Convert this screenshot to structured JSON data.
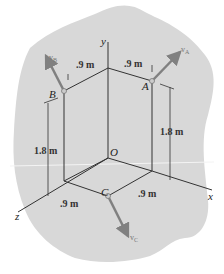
{
  "diagram": {
    "type": "3d-rigid-frame-velocities",
    "background_color": "#d8d8d8",
    "line_color": "#333333",
    "vector_color": "#808080",
    "axes": {
      "x": "x",
      "y": "y",
      "z": "z"
    },
    "origin_label": "O",
    "points": {
      "A": "A",
      "B": "B",
      "C": "C"
    },
    "velocities": {
      "A": "v_A",
      "B": "v_B",
      "C": "v_C",
      "A_main": "v",
      "A_sub": "A",
      "B_main": "v",
      "B_sub": "B",
      "C_main": "v",
      "C_sub": "C"
    },
    "dimensions": {
      "top_left": ".9 m",
      "top_right": ".9 m",
      "left_height": "1.8 m",
      "right_height": "1.8 m",
      "bottom_left": ".9 m",
      "bottom_right": ".9 m"
    }
  }
}
